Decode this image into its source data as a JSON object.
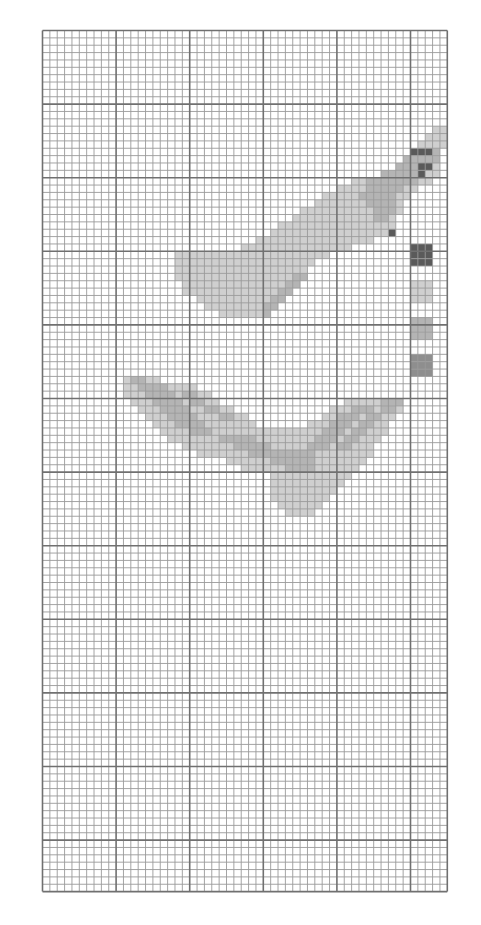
{
  "pattern": {
    "title": "Cross-stitch pattern chart",
    "grid": {
      "columns": 55,
      "rows": 117,
      "major_every": 10
    },
    "colors": {
      "background": "#ffffff",
      "minor_line": "#9a9a9a",
      "major_line": "#707070",
      "light": "#cfcfcf",
      "mid": "#b4b4b4",
      "dark": "#8e8e8e",
      "darkest": "#5a5a5a"
    },
    "palette_swatches": [
      {
        "name": "darkest",
        "color": "#5a5a5a"
      },
      {
        "name": "light",
        "color": "#d2d2d2"
      },
      {
        "name": "mid-light",
        "color": "#c4c4c4"
      },
      {
        "name": "mid",
        "color": "#a9a9a9"
      }
    ],
    "motifs": [
      {
        "name": "upper-bird",
        "runs": [
          [
            "light",
            13,
            53,
            54
          ],
          [
            "light",
            14,
            52,
            54
          ],
          [
            "light",
            15,
            51,
            54
          ],
          [
            "darkest",
            16,
            50,
            52
          ],
          [
            "mid",
            16,
            53,
            53
          ],
          [
            "mid",
            17,
            49,
            53
          ],
          [
            "darkest",
            18,
            51,
            52
          ],
          [
            "mid",
            18,
            48,
            50
          ],
          [
            "light",
            18,
            53,
            53
          ],
          [
            "darkest",
            19,
            51,
            51
          ],
          [
            "mid",
            19,
            46,
            50
          ],
          [
            "light",
            19,
            52,
            53
          ],
          [
            "mid",
            20,
            44,
            50
          ],
          [
            "light",
            20,
            42,
            43
          ],
          [
            "light",
            20,
            51,
            52
          ],
          [
            "light",
            21,
            40,
            50
          ],
          [
            "mid",
            21,
            44,
            48
          ],
          [
            "light",
            22,
            38,
            49
          ],
          [
            "mid",
            22,
            43,
            47
          ],
          [
            "light",
            23,
            37,
            48
          ],
          [
            "mid",
            23,
            44,
            47
          ],
          [
            "light",
            24,
            35,
            48
          ],
          [
            "mid",
            24,
            45,
            47
          ],
          [
            "light",
            25,
            34,
            47
          ],
          [
            "mid",
            25,
            45,
            46
          ],
          [
            "light",
            26,
            32,
            47
          ],
          [
            "light",
            27,
            31,
            46
          ],
          [
            "darkest",
            27,
            47,
            47
          ],
          [
            "light",
            28,
            29,
            44
          ],
          [
            "light",
            29,
            27,
            41
          ],
          [
            "light",
            30,
            18,
            38
          ],
          [
            "light",
            31,
            18,
            36
          ],
          [
            "light",
            32,
            18,
            35
          ],
          [
            "light",
            33,
            18,
            34
          ],
          [
            "mid",
            33,
            34,
            35
          ],
          [
            "light",
            34,
            19,
            32
          ],
          [
            "mid",
            34,
            33,
            34
          ],
          [
            "light",
            35,
            19,
            31
          ],
          [
            "mid",
            35,
            32,
            33
          ],
          [
            "light",
            36,
            21,
            30
          ],
          [
            "mid",
            36,
            31,
            32
          ],
          [
            "light",
            37,
            22,
            29
          ],
          [
            "mid",
            37,
            30,
            31
          ],
          [
            "light",
            38,
            24,
            29
          ],
          [
            "mid",
            38,
            30,
            30
          ]
        ]
      },
      {
        "name": "lower-bird",
        "runs": [
          [
            "light",
            47,
            11,
            15
          ],
          [
            "mid",
            47,
            12,
            13
          ],
          [
            "light",
            48,
            11,
            20
          ],
          [
            "mid",
            48,
            13,
            16
          ],
          [
            "light",
            49,
            11,
            22
          ],
          [
            "mid",
            49,
            14,
            17
          ],
          [
            "mid",
            49,
            19,
            20
          ],
          [
            "mid",
            50,
            46,
            48
          ],
          [
            "light",
            50,
            41,
            45
          ],
          [
            "light",
            50,
            12,
            23
          ],
          [
            "mid",
            50,
            15,
            18
          ],
          [
            "mid",
            50,
            20,
            21
          ],
          [
            "light",
            51,
            13,
            25
          ],
          [
            "mid",
            51,
            16,
            19
          ],
          [
            "mid",
            51,
            22,
            23
          ],
          [
            "light",
            51,
            39,
            48
          ],
          [
            "mid",
            51,
            42,
            44
          ],
          [
            "mid",
            51,
            46,
            47
          ],
          [
            "light",
            52,
            14,
            27
          ],
          [
            "mid",
            52,
            17,
            20
          ],
          [
            "mid",
            52,
            24,
            25
          ],
          [
            "light",
            52,
            38,
            47
          ],
          [
            "mid",
            52,
            40,
            42
          ],
          [
            "mid",
            52,
            44,
            45
          ],
          [
            "light",
            53,
            15,
            28
          ],
          [
            "mid",
            53,
            18,
            21
          ],
          [
            "light",
            53,
            36,
            46
          ],
          [
            "mid",
            53,
            39,
            41
          ],
          [
            "mid",
            53,
            43,
            44
          ],
          [
            "light",
            54,
            16,
            46
          ],
          [
            "mid",
            54,
            20,
            22
          ],
          [
            "mid",
            54,
            38,
            40
          ],
          [
            "mid",
            54,
            42,
            43
          ],
          [
            "light",
            55,
            17,
            45
          ],
          [
            "mid",
            55,
            24,
            28
          ],
          [
            "mid",
            55,
            37,
            39
          ],
          [
            "mid",
            55,
            41,
            42
          ],
          [
            "light",
            56,
            19,
            44
          ],
          [
            "mid",
            56,
            26,
            30
          ],
          [
            "mid",
            56,
            36,
            38
          ],
          [
            "mid",
            56,
            40,
            41
          ],
          [
            "light",
            57,
            21,
            44
          ],
          [
            "mid",
            57,
            28,
            36
          ],
          [
            "light",
            58,
            25,
            43
          ],
          [
            "mid",
            58,
            31,
            36
          ],
          [
            "light",
            59,
            27,
            42
          ],
          [
            "mid",
            59,
            33,
            36
          ],
          [
            "light",
            60,
            31,
            41
          ],
          [
            "light",
            61,
            31,
            40
          ],
          [
            "light",
            62,
            31,
            39
          ],
          [
            "light",
            63,
            31,
            38
          ],
          [
            "light",
            64,
            32,
            37
          ],
          [
            "light",
            65,
            33,
            36
          ]
        ]
      }
    ],
    "swatch_runs": [
      [
        "darkest",
        29,
        50,
        52
      ],
      [
        "darkest",
        30,
        50,
        52
      ],
      [
        "darkest",
        31,
        50,
        52
      ],
      [
        "light",
        34,
        50,
        52
      ],
      [
        "light",
        35,
        50,
        52
      ],
      [
        "light",
        36,
        50,
        52
      ],
      [
        "mid",
        39,
        50,
        52
      ],
      [
        "mid",
        40,
        50,
        52
      ],
      [
        "mid",
        41,
        50,
        52
      ],
      [
        "dark",
        44,
        50,
        52
      ],
      [
        "dark",
        45,
        50,
        52
      ],
      [
        "dark",
        46,
        50,
        52
      ]
    ]
  }
}
